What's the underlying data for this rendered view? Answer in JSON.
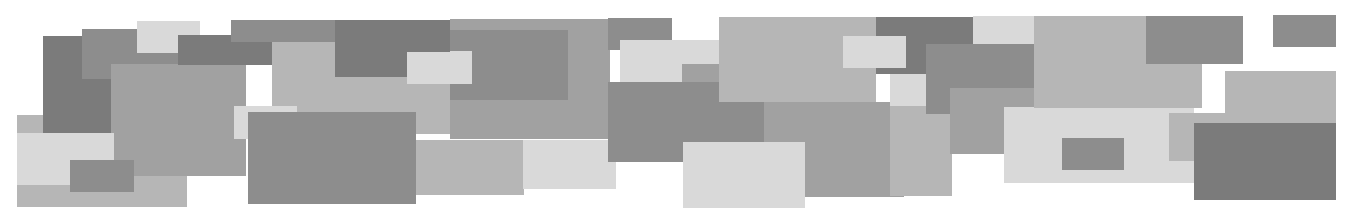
{
  "artwork": {
    "type": "abstract-rectangle-collage",
    "background": "#ffffff",
    "palette": {
      "dark": "#7b7b7b",
      "middark": "#8d8d8d",
      "mid": "#a1a1a1",
      "lightmid": "#b6b6b6",
      "light": "#d9d9d9"
    },
    "rects": [
      {
        "x": 17,
        "y": 115,
        "w": 170,
        "h": 92,
        "c": "lightmid"
      },
      {
        "x": 43,
        "y": 36,
        "w": 68,
        "h": 97,
        "c": "dark"
      },
      {
        "x": 82,
        "y": 29,
        "w": 96,
        "h": 50,
        "c": "middark"
      },
      {
        "x": 111,
        "y": 64,
        "w": 135,
        "h": 112,
        "c": "mid"
      },
      {
        "x": 17,
        "y": 133,
        "w": 97,
        "h": 52,
        "c": "light"
      },
      {
        "x": 70,
        "y": 160,
        "w": 64,
        "h": 32,
        "c": "middark"
      },
      {
        "x": 137,
        "y": 21,
        "w": 63,
        "h": 32,
        "c": "light"
      },
      {
        "x": 178,
        "y": 35,
        "w": 120,
        "h": 30,
        "c": "dark"
      },
      {
        "x": 231,
        "y": 20,
        "w": 220,
        "h": 22,
        "c": "middark"
      },
      {
        "x": 272,
        "y": 42,
        "w": 180,
        "h": 92,
        "c": "lightmid"
      },
      {
        "x": 335,
        "y": 20,
        "w": 115,
        "h": 57,
        "c": "dark"
      },
      {
        "x": 407,
        "y": 52,
        "w": 64,
        "h": 32,
        "c": "light"
      },
      {
        "x": 450,
        "y": 19,
        "w": 160,
        "h": 120,
        "c": "mid"
      },
      {
        "x": 450,
        "y": 30,
        "w": 118,
        "h": 70,
        "c": "middark"
      },
      {
        "x": 450,
        "y": 51,
        "w": 22,
        "h": 33,
        "c": "light"
      },
      {
        "x": 234,
        "y": 106,
        "w": 63,
        "h": 33,
        "c": "light"
      },
      {
        "x": 248,
        "y": 112,
        "w": 168,
        "h": 92,
        "c": "middark"
      },
      {
        "x": 416,
        "y": 140,
        "w": 108,
        "h": 55,
        "c": "lightmid"
      },
      {
        "x": 523,
        "y": 140,
        "w": 93,
        "h": 49,
        "c": "light"
      },
      {
        "x": 608,
        "y": 18,
        "w": 64,
        "h": 32,
        "c": "middark"
      },
      {
        "x": 620,
        "y": 40,
        "w": 100,
        "h": 42,
        "c": "light"
      },
      {
        "x": 682,
        "y": 64,
        "w": 40,
        "h": 22,
        "c": "mid"
      },
      {
        "x": 608,
        "y": 82,
        "w": 156,
        "h": 80,
        "c": "middark"
      },
      {
        "x": 719,
        "y": 17,
        "w": 157,
        "h": 85,
        "c": "lightmid"
      },
      {
        "x": 764,
        "y": 102,
        "w": 140,
        "h": 95,
        "c": "mid"
      },
      {
        "x": 683,
        "y": 142,
        "w": 122,
        "h": 66,
        "c": "light"
      },
      {
        "x": 876,
        "y": 17,
        "w": 97,
        "h": 57,
        "c": "dark"
      },
      {
        "x": 843,
        "y": 36,
        "w": 63,
        "h": 32,
        "c": "light"
      },
      {
        "x": 890,
        "y": 74,
        "w": 60,
        "h": 32,
        "c": "light"
      },
      {
        "x": 890,
        "y": 106,
        "w": 62,
        "h": 90,
        "c": "lightmid"
      },
      {
        "x": 926,
        "y": 44,
        "w": 108,
        "h": 70,
        "c": "middark"
      },
      {
        "x": 950,
        "y": 88,
        "w": 122,
        "h": 66,
        "c": "mid"
      },
      {
        "x": 973,
        "y": 16,
        "w": 62,
        "h": 28,
        "c": "light"
      },
      {
        "x": 1004,
        "y": 107,
        "w": 190,
        "h": 76,
        "c": "light"
      },
      {
        "x": 1034,
        "y": 16,
        "w": 168,
        "h": 92,
        "c": "lightmid"
      },
      {
        "x": 1062,
        "y": 138,
        "w": 62,
        "h": 32,
        "c": "middark"
      },
      {
        "x": 1146,
        "y": 16,
        "w": 97,
        "h": 48,
        "c": "middark"
      },
      {
        "x": 1169,
        "y": 113,
        "w": 95,
        "h": 48,
        "c": "lightmid"
      },
      {
        "x": 1225,
        "y": 71,
        "w": 111,
        "h": 52,
        "c": "lightmid"
      },
      {
        "x": 1194,
        "y": 123,
        "w": 142,
        "h": 77,
        "c": "dark"
      },
      {
        "x": 1273,
        "y": 15,
        "w": 63,
        "h": 32,
        "c": "middark"
      }
    ]
  }
}
